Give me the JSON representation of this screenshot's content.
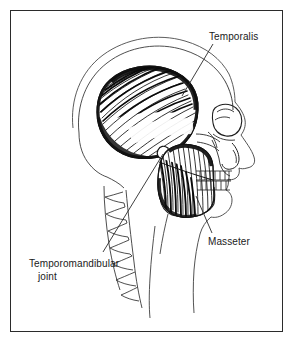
{
  "figure": {
    "background_color": "#ffffff",
    "border_color": "#2b2b2b",
    "ink_color": "#1a1a1a"
  },
  "labels": {
    "temporalis": "Temporalis",
    "masseter": "Masseter",
    "tmj_line1": "Temporomandibular",
    "tmj_line2": "joint"
  },
  "anatomy": {
    "structures": [
      "cranium-outline",
      "scalp-outline",
      "temporalis-muscle",
      "masseter-muscle",
      "mandible",
      "maxilla",
      "orbit",
      "nasal-aperture",
      "zygomatic-arch",
      "upper-teeth",
      "lower-teeth",
      "cervical-vertebrae",
      "face-profile",
      "neck-profile",
      "mandibular-condyle"
    ],
    "leader_lines": [
      "temporalis-leader",
      "masseter-leader",
      "tmj-leader"
    ]
  }
}
